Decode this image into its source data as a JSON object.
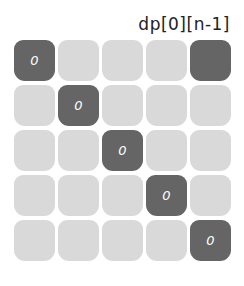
{
  "title": "dp[0][n-1]",
  "colors": {
    "light": "#d9d9d9",
    "dark": "#656565",
    "text": "#ffffff"
  },
  "grid": {
    "rows": [
      [
        {
          "v": "0",
          "dark": true
        },
        {
          "v": "",
          "dark": false
        },
        {
          "v": "",
          "dark": false
        },
        {
          "v": "",
          "dark": false
        },
        {
          "v": "",
          "dark": true
        }
      ],
      [
        {
          "v": "",
          "dark": false
        },
        {
          "v": "0",
          "dark": true
        },
        {
          "v": "",
          "dark": false
        },
        {
          "v": "",
          "dark": false
        },
        {
          "v": "",
          "dark": false
        }
      ],
      [
        {
          "v": "",
          "dark": false
        },
        {
          "v": "",
          "dark": false
        },
        {
          "v": "0",
          "dark": true
        },
        {
          "v": "",
          "dark": false
        },
        {
          "v": "",
          "dark": false
        }
      ],
      [
        {
          "v": "",
          "dark": false
        },
        {
          "v": "",
          "dark": false
        },
        {
          "v": "",
          "dark": false
        },
        {
          "v": "0",
          "dark": true
        },
        {
          "v": "",
          "dark": false
        }
      ],
      [
        {
          "v": "",
          "dark": false
        },
        {
          "v": "",
          "dark": false
        },
        {
          "v": "",
          "dark": false
        },
        {
          "v": "",
          "dark": false
        },
        {
          "v": "0",
          "dark": true
        }
      ]
    ]
  }
}
